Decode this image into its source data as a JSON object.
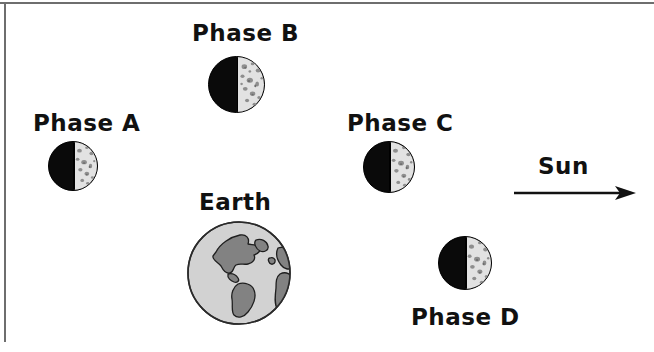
{
  "figure": {
    "background_color": "#ffffff",
    "border_color": "#6e6e6e",
    "ink_color": "#111111"
  },
  "labels": {
    "phase_a": "Phase A",
    "phase_b": "Phase B",
    "phase_c": "Phase C",
    "phase_d": "Phase D",
    "earth": "Earth",
    "sun": "Sun"
  },
  "moons": [
    {
      "id": "phase-a",
      "label": "Phase A",
      "dark_side": "left",
      "lit_side": "right",
      "lit_color": "#e2e2e2",
      "dark_color": "#0a0a0a",
      "diameter_px": 50
    },
    {
      "id": "phase-b",
      "label": "Phase B",
      "dark_side": "left",
      "lit_side": "right",
      "lit_color": "#e2e2e2",
      "dark_color": "#0a0a0a",
      "diameter_px": 57
    },
    {
      "id": "phase-c",
      "label": "Phase C",
      "dark_side": "left",
      "lit_side": "right",
      "lit_color": "#e2e2e2",
      "dark_color": "#0a0a0a",
      "diameter_px": 52
    },
    {
      "id": "phase-d",
      "label": "Phase D",
      "dark_side": "left",
      "lit_side": "right",
      "lit_color": "#e2e2e2",
      "dark_color": "#0a0a0a",
      "diameter_px": 54
    }
  ],
  "earth": {
    "label": "Earth",
    "ocean_color": "#d2d2d2",
    "land_color": "#828282",
    "outline_color": "#1a1a1a",
    "diameter_px": 105
  },
  "sun": {
    "label": "Sun",
    "arrow_direction": "right",
    "arrow_color": "#111111"
  }
}
